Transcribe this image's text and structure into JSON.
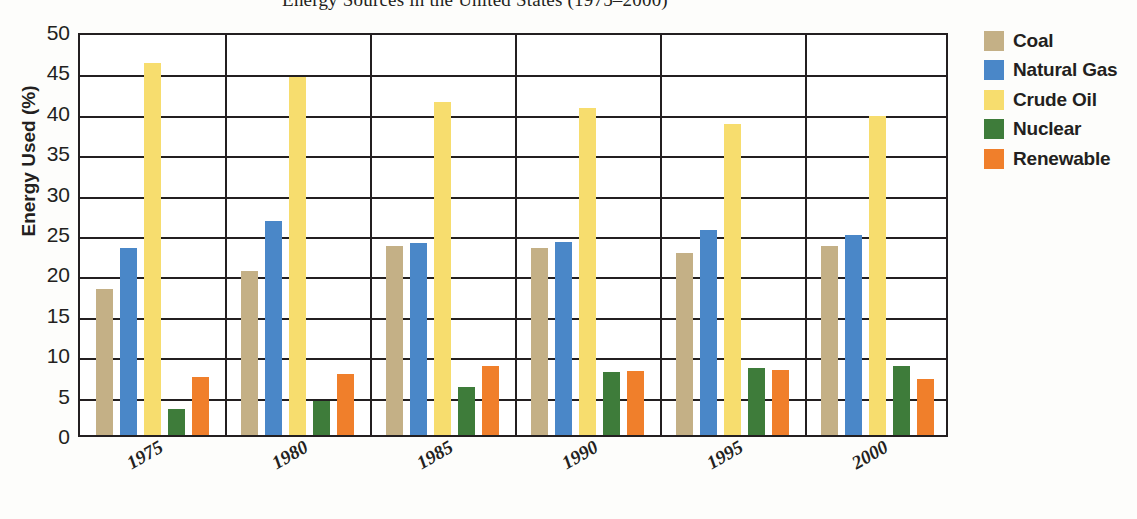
{
  "chart_data": {
    "type": "bar",
    "title": "Energy Sources in the United States (1975–2000)",
    "xlabel": "",
    "ylabel": "Energy Used (%)",
    "categories": [
      "1975",
      "1980",
      "1985",
      "1990",
      "1995",
      "2000"
    ],
    "ylim": [
      0,
      50
    ],
    "yticks": [
      0,
      5,
      10,
      15,
      20,
      25,
      30,
      35,
      40,
      45,
      50
    ],
    "grid": true,
    "legend_position": "right",
    "series": [
      {
        "name": "Coal",
        "color": "#c4b086",
        "values": [
          18.1,
          20.3,
          23.4,
          23.2,
          22.5,
          23.4
        ]
      },
      {
        "name": "Natural Gas",
        "color": "#4a87c8",
        "values": [
          23.2,
          26.5,
          23.8,
          23.9,
          25.4,
          24.8
        ]
      },
      {
        "name": "Crude Oil",
        "color": "#f7dd6e",
        "values": [
          46.1,
          44.3,
          41.2,
          40.5,
          38.5,
          39.5
        ]
      },
      {
        "name": "Nuclear",
        "color": "#3e7c3a",
        "values": [
          3.2,
          4.2,
          5.9,
          7.8,
          8.3,
          8.5
        ]
      },
      {
        "name": "Renewable",
        "color": "#f07f2b",
        "values": [
          7.2,
          7.6,
          8.6,
          7.9,
          8.0,
          6.9
        ]
      }
    ]
  },
  "axis": {
    "y_title": "Energy Used (%)",
    "y_tick_labels": [
      "50",
      "45",
      "40",
      "35",
      "30",
      "25",
      "20",
      "15",
      "10",
      "5",
      "0"
    ],
    "x_tick_labels": [
      "1975",
      "1980",
      "1985",
      "1990",
      "1995",
      "2000"
    ]
  },
  "legend": {
    "items": [
      {
        "label": "Coal",
        "color": "#c4b086"
      },
      {
        "label": "Natural Gas",
        "color": "#4a87c8"
      },
      {
        "label": "Crude Oil",
        "color": "#f7dd6e"
      },
      {
        "label": "Nuclear",
        "color": "#3e7c3a"
      },
      {
        "label": "Renewable",
        "color": "#f07f2b"
      }
    ]
  }
}
